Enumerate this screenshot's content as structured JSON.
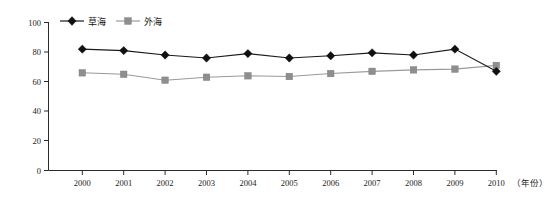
{
  "chart_data": {
    "type": "line",
    "title": "",
    "xlabel": "（年份）",
    "ylabel": "",
    "categories": [
      "2000",
      "2001",
      "2002",
      "2003",
      "2004",
      "2005",
      "2006",
      "2007",
      "2008",
      "2009",
      "2010"
    ],
    "x": [
      2000,
      2001,
      2002,
      2003,
      2004,
      2005,
      2006,
      2007,
      2008,
      2009,
      2010
    ],
    "series": [
      {
        "name": "草海",
        "marker": "diamond",
        "color": "#101010",
        "values": [
          82,
          81,
          78,
          76,
          79,
          76,
          77.5,
          79.5,
          78,
          82,
          67
        ]
      },
      {
        "name": "外海",
        "marker": "square",
        "color": "#8e8e8e",
        "values": [
          66,
          65,
          61,
          63,
          64,
          63.5,
          65.5,
          67,
          68,
          68.5,
          71
        ]
      }
    ],
    "ylim": [
      0,
      100
    ],
    "yticks": [
      0,
      20,
      40,
      60,
      80,
      100
    ],
    "ytick_labels": [
      "0",
      "20",
      "40",
      "60",
      "80",
      "100"
    ],
    "xtick_labels": [
      "2000",
      "2001",
      "2002",
      "2003",
      "2004",
      "2005",
      "2006",
      "2007",
      "2008",
      "2009",
      "2010"
    ],
    "grid": false,
    "legend_position": "top-left",
    "legend_entries": [
      "草海",
      "外海"
    ]
  },
  "axis": {
    "x_caption": "（年份）"
  },
  "legend": {
    "items": [
      {
        "label": "草海"
      },
      {
        "label": "外海"
      }
    ]
  }
}
